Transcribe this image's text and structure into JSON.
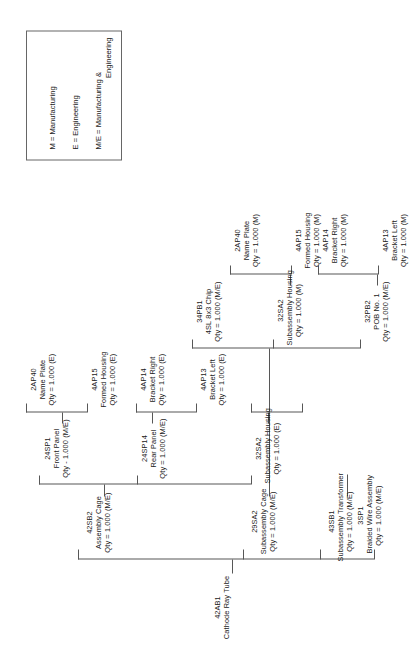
{
  "diagram": {
    "orientation": "rotated-90-ccw",
    "root": {
      "code": "42AB1",
      "desc": "Cathode Ray Tube",
      "qty": ""
    },
    "nodes": [
      {
        "id": "n_42SB2",
        "code": "42SB2",
        "desc": "Assembly Cage",
        "qty": "Qty = 1.000 (M/E)"
      },
      {
        "id": "n_24SP1",
        "code": "24SP1",
        "desc": "Front Panel",
        "qty": "Qty - 1.000 (M/E)"
      },
      {
        "id": "n_2AP40a",
        "code": "2AP40",
        "desc": "Name Plate",
        "qty": "Qty = 1.000 (E)"
      },
      {
        "id": "n_4AP15a",
        "code": "4AP15",
        "desc": "Formed Housing",
        "qty": "Qty = 1.000 (E)"
      },
      {
        "id": "n_24SP14",
        "code": "24SP14",
        "desc": "Rear Panel",
        "qty": "Qty = 1.000 (M/E)"
      },
      {
        "id": "n_4AP14a",
        "code": "4AP14",
        "desc": "Bracket Right",
        "qty": "Qty = 1.000 (E)"
      },
      {
        "id": "n_4AP13a",
        "code": "4AP13",
        "desc": "Bracket Left",
        "qty": "Qty = 1.000 (E)"
      },
      {
        "id": "n_32SA2a",
        "code": "32SA2",
        "desc": "Subassembly Housing",
        "qty": "Qty = 1.000 (E)"
      },
      {
        "id": "n_29SA2",
        "code": "29SA2",
        "desc": "Subassembly Cage",
        "qty": "Qty = 1.000 (M/E)"
      },
      {
        "id": "n_34PB1",
        "code": "34PB1",
        "desc": "4SL 8x3 Chip",
        "qty": "Qty = 1.000 (M/E)"
      },
      {
        "id": "n_2AP40b",
        "code": "2AP40",
        "desc": "Name Plate",
        "qty": "Qty = 1.000 (M)"
      },
      {
        "id": "n_4AP15b",
        "code": "4AP15",
        "desc": "Formed Housing",
        "qty": "Qty = 1.000 (M)"
      },
      {
        "id": "n_32SA2b",
        "code": "32SA2",
        "desc": "Subassembly Housing",
        "qty": "Qty = 1.000 (M)"
      },
      {
        "id": "n_4AP14b",
        "code": "4AP14",
        "desc": "Bracket Right",
        "qty": "Qty = 1.000 (M)"
      },
      {
        "id": "n_32PB2",
        "code": "32PB2",
        "desc": "POB No. 1",
        "qty": "Qty = 1.000 (M/E)"
      },
      {
        "id": "n_4AP13b",
        "code": "4AP13",
        "desc": "Bracket Left",
        "qty": "Qty = 1.000 (M)"
      },
      {
        "id": "n_43SB1",
        "code": "43SB1",
        "desc": "Subassembly Transformer",
        "qty": "Qty = 1.000 (M/E)"
      },
      {
        "id": "n_3SP1",
        "code": "3SP1",
        "desc": "Braided Wire Assembly",
        "qty": "Qty = 1.000 (M/E)"
      }
    ]
  },
  "legend": {
    "rows": [
      {
        "text": "M = Manufacturing",
        "cont": ""
      },
      {
        "text": "E = Engineering",
        "cont": ""
      },
      {
        "text": "M/E = Manufacturing &",
        "cont": "Engineering"
      }
    ]
  },
  "caption": {
    "text": ""
  }
}
